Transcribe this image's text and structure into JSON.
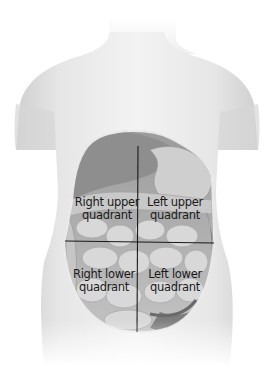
{
  "diagram": {
    "quadrants": [
      {
        "id": "ruq",
        "line1": "Right upper",
        "line2": "quadrant"
      },
      {
        "id": "luq",
        "line1": "Left upper",
        "line2": "quadrant"
      },
      {
        "id": "rlq",
        "line1": "Right lower",
        "line2": "quadrant"
      },
      {
        "id": "llq",
        "line1": "Left lower",
        "line2": "quadrant"
      }
    ],
    "colors": {
      "background": "#ffffff",
      "skin": "#ebebeb",
      "skin_shadow": "#c8c8c8",
      "organ_dark": "#8c8c8c",
      "organ_mid": "#b4b4b4",
      "organ_light": "#d6d6d6",
      "divider": "#1a1a1a",
      "text": "#1a1a1a"
    }
  }
}
